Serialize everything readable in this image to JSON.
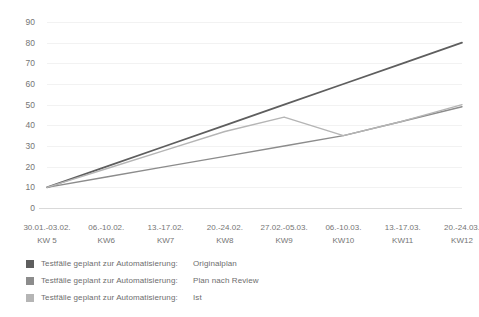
{
  "chart_data": {
    "type": "line",
    "title": "",
    "xlabel": "",
    "ylabel": "",
    "ylim": [
      0,
      90
    ],
    "yticks": [
      0,
      10,
      20,
      30,
      40,
      50,
      60,
      70,
      80,
      90
    ],
    "grid": true,
    "legend_position": "bottom-left",
    "categories": [
      "30.01.-03.02.",
      "06.-10.02.",
      "13.-17.02.",
      "20.-24.02.",
      "27.02.-05.03.",
      "06.-10.03.",
      "13.-17.03.",
      "20.-24.03."
    ],
    "category_sublabels": [
      "KW 5",
      "KW6",
      "KW7",
      "KW8",
      "KW9",
      "KW10",
      "KW11",
      "KW12"
    ],
    "series": [
      {
        "name": "Testfälle geplant zur Automatisierung:",
        "variant": "Originalplan",
        "color": "#5e5e5e",
        "values": [
          10,
          20,
          30,
          40,
          50,
          60,
          70,
          80
        ]
      },
      {
        "name": "Testfälle geplant zur Automatisierung:",
        "variant": "Plan nach Review",
        "color": "#8c8c8c",
        "values": [
          10,
          15,
          20,
          25,
          30,
          35,
          42,
          49
        ]
      },
      {
        "name": "Testfälle geplant zur Automatisierung:",
        "variant": "Ist",
        "color": "#b5b5b5",
        "values": [
          10,
          19,
          28,
          37,
          44,
          35,
          42,
          50
        ]
      }
    ]
  },
  "colors": {
    "background": "#ffffff",
    "gridline": "#f2f2f2",
    "axis": "#d9d9d9",
    "tick_text": "#757575",
    "legend_text": "#6d6d6d"
  }
}
